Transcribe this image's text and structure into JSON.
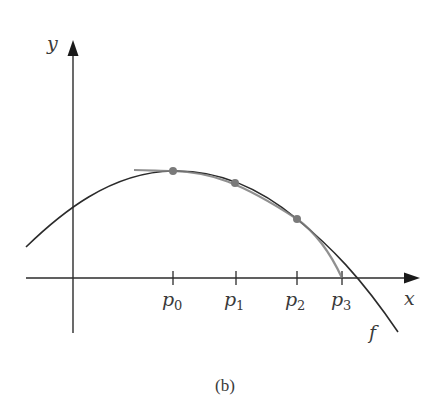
{
  "figure": {
    "caption": "(b)",
    "x_axis_label": "x",
    "y_axis_label": "y",
    "function_label": "f",
    "points": [
      {
        "name": "p",
        "sub": "0"
      },
      {
        "name": "p",
        "sub": "1"
      },
      {
        "name": "p",
        "sub": "2"
      },
      {
        "name": "p",
        "sub": "3"
      }
    ],
    "colors": {
      "function_curve": "#2b2b2b",
      "approx_curve": "#808080",
      "points": "#7a7a7a",
      "axes": "#2b2b2b"
    }
  }
}
